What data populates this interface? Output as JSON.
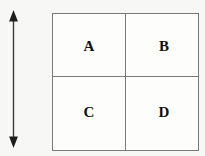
{
  "figure": {
    "type": "diagram",
    "background_color": "#f7f7f5",
    "width": 205,
    "height": 156
  },
  "annotation": {
    "arrow": {
      "icon": "double-headed-vertical-arrow-icon",
      "orientation": "vertical",
      "heads": "both-ends",
      "color": "#3a3a3a",
      "label": ""
    }
  },
  "grid": {
    "columns": 2,
    "rows": 2,
    "border_color": "#7a7a7a",
    "cell_fill": "#fdfdfc",
    "text_color": "#111111",
    "cells": [
      [
        {
          "label": "A",
          "name": "grid-cell-a"
        },
        {
          "label": "B",
          "name": "grid-cell-b"
        }
      ],
      [
        {
          "label": "C",
          "name": "grid-cell-c"
        },
        {
          "label": "D",
          "name": "grid-cell-d"
        }
      ]
    ]
  }
}
